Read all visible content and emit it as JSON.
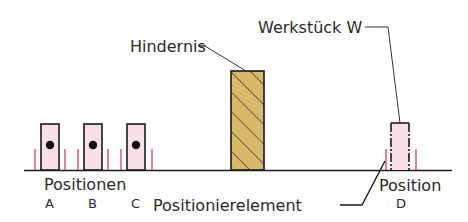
{
  "diagram": {
    "labels": {
      "obstacle": "Hindernis",
      "workpiece": "Werkstück W",
      "positions_group": "Positionen",
      "position_a": "A",
      "position_b": "B",
      "position_c": "C",
      "positioning_element": "Positionierelement",
      "position_d_title": "Position",
      "position_d": "D"
    },
    "colors": {
      "workpiece_fill": "#f9dfe6",
      "positioner_line": "#d8506e",
      "obstacle_fill": "#d9b86a",
      "outline": "#1a1a1a",
      "text": "#2a2a2a"
    }
  }
}
